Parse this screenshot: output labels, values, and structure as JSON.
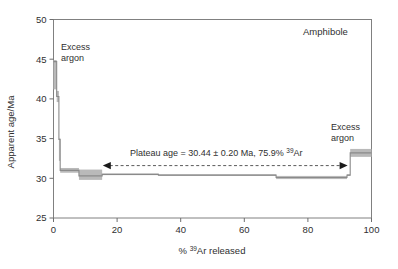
{
  "figure": {
    "sample_label": "Amphibole",
    "background_color": "#ffffff",
    "step_color": "#8a8a8a",
    "error_box_color": "#b9b9b9"
  },
  "axes": {
    "x": {
      "title_prefix": "% ",
      "title_sup": "39",
      "title_suffix": "Ar released",
      "min": 0,
      "max": 100,
      "ticks": [
        "0",
        "20",
        "40",
        "60",
        "80",
        "100"
      ],
      "tick_values": [
        0,
        20,
        40,
        60,
        80,
        100
      ]
    },
    "y": {
      "title": "Apparent age/Ma",
      "min": 25,
      "max": 50,
      "ticks": [
        "25",
        "30",
        "35",
        "40",
        "45",
        "50"
      ],
      "tick_values": [
        25,
        30,
        35,
        40,
        45,
        50
      ]
    }
  },
  "annotations": {
    "excess_argon_left": {
      "line1": "Excess",
      "line2": "argon"
    },
    "excess_argon_right": {
      "line1": "Excess",
      "line2": "argon"
    },
    "plateau": {
      "text_prefix": "Plateau age = 30.44 ± 0.20 Ma,  75.9% ",
      "text_sup": "39",
      "text_suffix": "Ar",
      "age": 30.44,
      "uncertainty": 0.2,
      "unit": "Ma",
      "percent_ar39": 75.9,
      "y_value": 31.6,
      "x_start": 15.5,
      "x_end": 92.5
    }
  },
  "chart_data": {
    "type": "line",
    "title": "",
    "subtitle": "",
    "xlabel": "% 39Ar released",
    "ylabel": "Apparent age/Ma",
    "xlim": [
      0,
      100
    ],
    "ylim": [
      25,
      50
    ],
    "grid": false,
    "legend": "none",
    "steps": [
      {
        "x_start": 0.0,
        "x_end": 1.0,
        "age": 44.7,
        "err_low": 41.2,
        "err_high": 44.9
      },
      {
        "x_start": 1.0,
        "x_end": 1.7,
        "age": 40.3,
        "err_low": 39.6,
        "err_high": 41.0
      },
      {
        "x_start": 1.7,
        "x_end": 2.1,
        "age": 34.9,
        "err_low": 32.2,
        "err_high": 35.0
      },
      {
        "x_start": 2.1,
        "x_end": 8.0,
        "age": 31.0,
        "err_low": 30.7,
        "err_high": 31.3
      },
      {
        "x_start": 8.0,
        "x_end": 15.3,
        "age": 30.3,
        "err_low": 29.8,
        "err_high": 31.1
      },
      {
        "x_start": 15.3,
        "x_end": 33.0,
        "age": 30.5,
        "err_low": 30.4,
        "err_high": 30.6
      },
      {
        "x_start": 33.0,
        "x_end": 70.0,
        "age": 30.4,
        "err_low": 30.3,
        "err_high": 30.5
      },
      {
        "x_start": 70.0,
        "x_end": 92.3,
        "age": 30.1,
        "err_low": 29.9,
        "err_high": 30.3
      },
      {
        "x_start": 92.3,
        "x_end": 93.3,
        "age": 30.4,
        "err_low": 30.3,
        "err_high": 30.5
      },
      {
        "x_start": 93.3,
        "x_end": 100.0,
        "age": 33.2,
        "err_low": 32.7,
        "err_high": 33.7
      }
    ]
  }
}
